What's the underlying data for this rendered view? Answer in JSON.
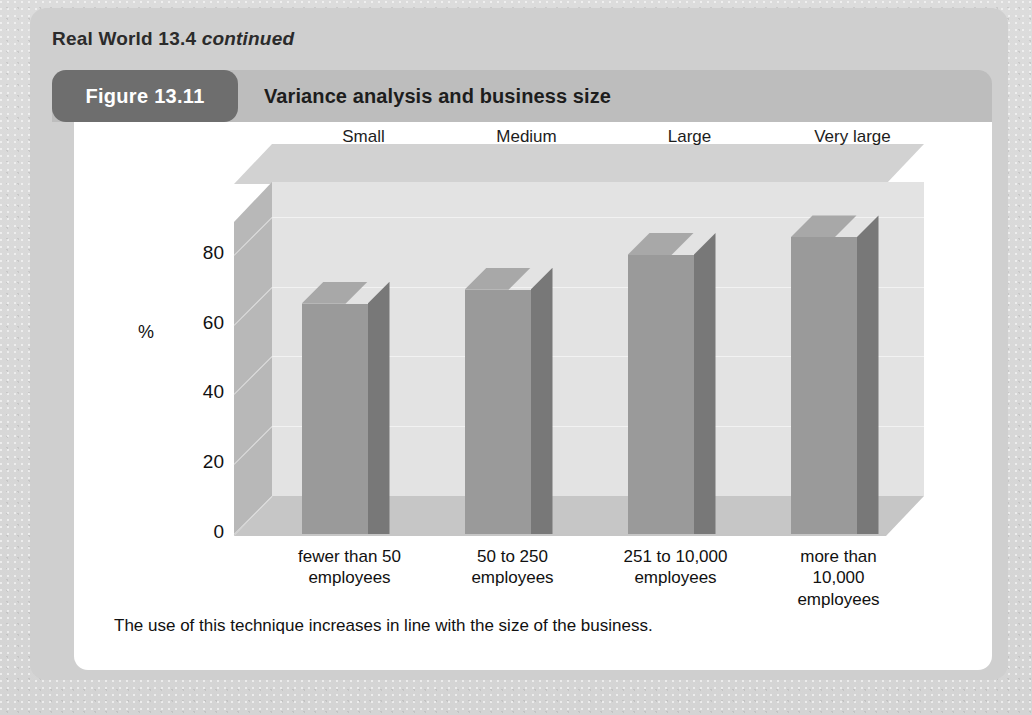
{
  "page": {
    "background_color": "#d9d9d9",
    "panel_color": "#cfcfcf"
  },
  "real_world": {
    "label": "Real World 13.4",
    "continued": "continued"
  },
  "figure": {
    "number_label": "Figure 13.11",
    "title": "Variance analysis and business size",
    "pill_color": "#6e6e6e",
    "header_color": "#bdbdbd",
    "note": "The use of this technique increases in line with the size of the business."
  },
  "chart_data": {
    "type": "bar",
    "title": "Variance analysis and business size",
    "xlabel": "",
    "ylabel": "%",
    "categories": [
      "fewer than 50 employees",
      "50 to 250 employees",
      "251 to 10,000 employees",
      "more than 10,000 employees"
    ],
    "category_lines": [
      [
        "fewer than 50",
        "employees"
      ],
      [
        "50 to 250",
        "employees"
      ],
      [
        "251 to 10,000",
        "employees"
      ],
      [
        "more than",
        "10,000",
        "employees"
      ]
    ],
    "series_labels": [
      "Small",
      "Medium",
      "Large",
      "Very large"
    ],
    "values": [
      66,
      70,
      80,
      85
    ],
    "ylim": [
      0,
      90
    ],
    "yticks": [
      0,
      20,
      40,
      60,
      80
    ],
    "ytick_labels": [
      "0",
      "20",
      "40",
      "60",
      "80"
    ],
    "grid": true,
    "legend": "none",
    "three_d": true,
    "bar_face_color": "#9a9a9a",
    "bar_side_color": "#787878",
    "bar_top_color": "#a8a8a8",
    "plot_background_color": "#e3e3e3",
    "floor_color": "#c6c6c6",
    "side_wall_color": "#b8b8b8"
  }
}
